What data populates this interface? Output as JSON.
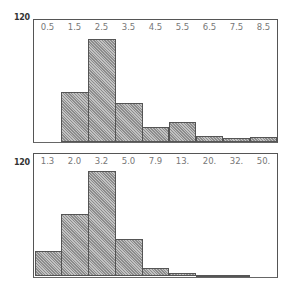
{
  "chart_data": [
    {
      "type": "bar",
      "title": "",
      "xlabel": "",
      "ylabel": "",
      "ylim": [
        0,
        120
      ],
      "yticks": [
        "120"
      ],
      "tick_labels": [
        "0.5",
        "1.5",
        "2.5",
        "3.5",
        "4.5",
        "5.5",
        "6.5",
        "7.5",
        "8.5"
      ],
      "categories": [
        "0.5-1.5",
        "1.5-2.5",
        "2.5-3.5",
        "3.5-4.5",
        "4.5-5.5",
        "5.5-6.5",
        "6.5-7.5",
        "7.5-8.5",
        "8.5+"
      ],
      "values": [
        0,
        50,
        103,
        39,
        15,
        20,
        6,
        4,
        5
      ],
      "grid": false,
      "legend": null
    },
    {
      "type": "bar",
      "title": "",
      "xlabel": "",
      "ylabel": "",
      "ylim": [
        0,
        120
      ],
      "yticks": [
        "120"
      ],
      "tick_labels": [
        "1.3",
        "2.0",
        "3.2",
        "5.0",
        "7.9",
        "13.",
        "20.",
        "32.",
        "50."
      ],
      "categories": [
        "1.3",
        "2.0",
        "3.2",
        "5.0",
        "7.9",
        "13.",
        "20.",
        "32.",
        "50."
      ],
      "values": [
        27,
        66,
        111,
        39,
        9,
        4,
        1,
        1,
        0
      ],
      "grid": false,
      "legend": null
    }
  ]
}
